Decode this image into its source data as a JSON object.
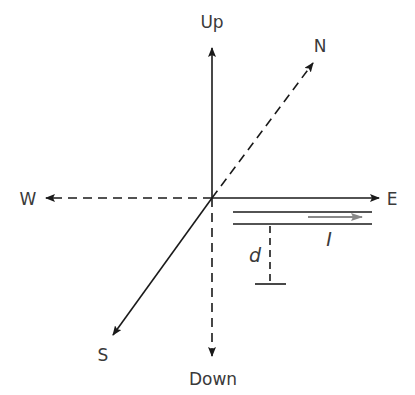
{
  "diagram": {
    "type": "coordinate-axes",
    "labels": {
      "up": "Up",
      "down": "Down",
      "north": "N",
      "south": "S",
      "east": "E",
      "west": "W",
      "distance": "d",
      "current": "I"
    },
    "colors": {
      "line": "#1a1a1a",
      "text": "#3a3a3a",
      "current_arrow": "#888888",
      "background": "#ffffff"
    },
    "notes": {
      "solid_axes": [
        "Up",
        "E",
        "S"
      ],
      "dashed_axes": [
        "Down",
        "W",
        "N"
      ],
      "wire": "Two parallel horizontal lines below E-axis with current arrow pointing east",
      "distance_marker": "Dashed vertical line with T-end labeled d, measuring distance below the wire"
    }
  }
}
